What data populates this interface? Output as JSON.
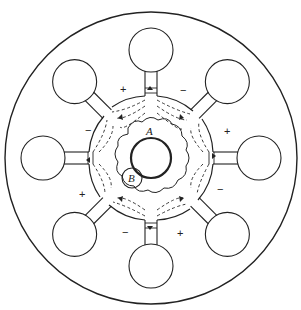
{
  "diagram": {
    "type": "magnetron-cross-section",
    "resonator_count": 8,
    "labels": {
      "electron_region_a": "A",
      "electron_region_b": "B"
    },
    "cavity_signs": [
      "+",
      "−",
      "+",
      "−",
      "+",
      "−",
      "+",
      "−"
    ],
    "sign_positions": [
      {
        "sign": "+",
        "x": 123,
        "y": 89
      },
      {
        "sign": "−",
        "x": 183,
        "y": 90
      },
      {
        "sign": "+",
        "x": 227,
        "y": 131
      },
      {
        "sign": "−",
        "x": 219,
        "y": 189
      },
      {
        "sign": "+",
        "x": 180,
        "y": 233
      },
      {
        "sign": "−",
        "x": 125,
        "y": 232
      },
      {
        "sign": "+",
        "x": 82,
        "y": 194
      },
      {
        "sign": "−",
        "x": 87,
        "y": 130
      }
    ],
    "colors": {
      "line": "#222222",
      "background": "#ffffff"
    }
  }
}
